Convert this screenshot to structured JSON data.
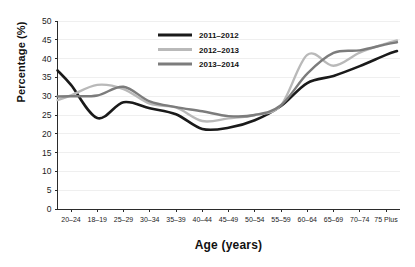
{
  "chart_data": {
    "type": "line",
    "title": "",
    "xlabel": "Age (years)",
    "ylabel": "Percentage (%)",
    "ylim": [
      0,
      50
    ],
    "yticks": [
      "0",
      "5",
      "10",
      "15",
      "20",
      "25",
      "30",
      "35",
      "40",
      "45",
      "50"
    ],
    "grid": true,
    "legend_position": "top-center",
    "categories": [
      "20–24",
      "18–19",
      "25–29",
      "30–34",
      "35–39",
      "40–44",
      "45–49",
      "50–54",
      "55–59",
      "60–64",
      "65–69",
      "70–74",
      "75 Plus"
    ],
    "series": [
      {
        "name": "2011–2012",
        "color": "#1a1a1a",
        "width": 2.6,
        "values": [
          33.0,
          24.2,
          28.4,
          26.8,
          25.2,
          21.3,
          21.6,
          23.6,
          27.4,
          33.5,
          35.4,
          38.0,
          41.0
        ]
      },
      {
        "name": "2012–2013",
        "color": "#b9b9b9",
        "width": 2.4,
        "values": [
          30.2,
          33.0,
          31.9,
          28.0,
          27.0,
          23.4,
          24.1,
          25.0,
          27.6,
          41.0,
          38.1,
          41.6,
          44.0
        ]
      },
      {
        "name": "2013–2014",
        "color": "#7c7c7c",
        "width": 2.4,
        "values": [
          30.0,
          30.2,
          32.5,
          28.6,
          27.1,
          26.0,
          24.7,
          25.0,
          27.6,
          36.0,
          41.5,
          42.2,
          43.8
        ]
      }
    ]
  },
  "legend": {
    "items": [
      {
        "label": "2011–2012"
      },
      {
        "label": "2012–2013"
      },
      {
        "label": "2013–2014"
      }
    ]
  },
  "axis": {
    "x_title": "Age (years)",
    "y_title": "Percentage (%)"
  }
}
